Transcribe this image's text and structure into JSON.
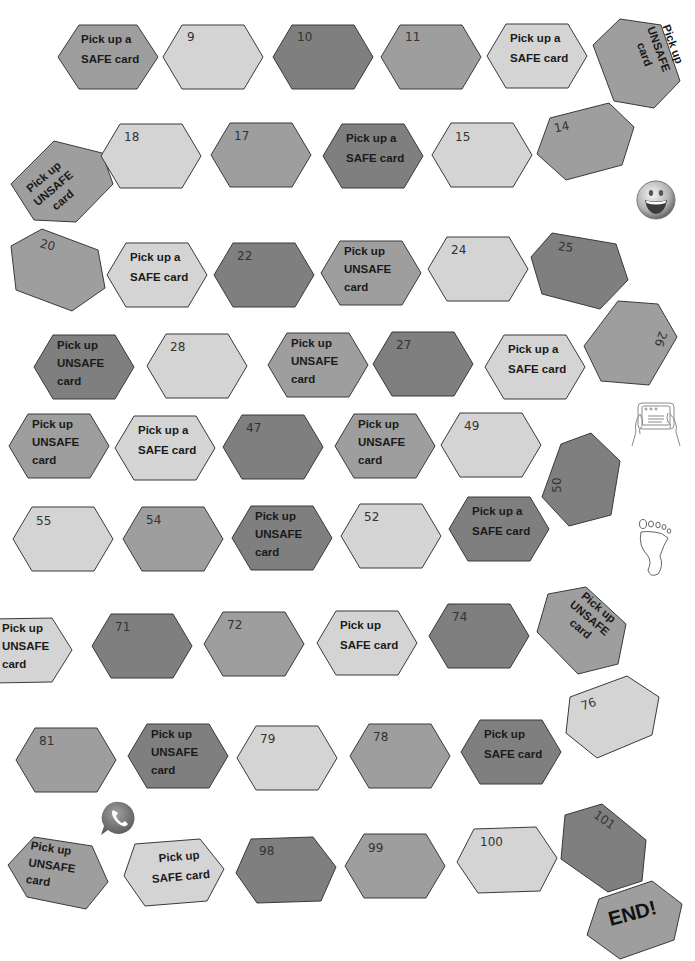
{
  "colors": {
    "light": "#d4d4d4",
    "mid": "#9e9e9e",
    "dark": "#7f7f7f",
    "border": "#3a3a3a"
  },
  "tiles": [
    {
      "id": "r1c1",
      "text": "Pick up a\nSAFE card",
      "shade": "mid"
    },
    {
      "id": "r1c2",
      "text": "9",
      "shade": "light"
    },
    {
      "id": "r1c3",
      "text": "10",
      "shade": "dark"
    },
    {
      "id": "r1c4",
      "text": "11",
      "shade": "mid"
    },
    {
      "id": "r1c5",
      "text": "Pick up a\nSAFE card",
      "shade": "light"
    },
    {
      "id": "r1c6",
      "text": "Pick up\nUNSAFE\ncard",
      "shade": "mid"
    },
    {
      "id": "r2c1",
      "text": "Pick up\nUNSAFE\ncard",
      "shade": "mid"
    },
    {
      "id": "r2c2",
      "text": "18",
      "shade": "light"
    },
    {
      "id": "r2c3",
      "text": "17",
      "shade": "mid"
    },
    {
      "id": "r2c4",
      "text": "Pick up a\nSAFE card",
      "shade": "dark"
    },
    {
      "id": "r2c5",
      "text": "15",
      "shade": "light"
    },
    {
      "id": "r2c6",
      "text": "14",
      "shade": "mid"
    },
    {
      "id": "r3c1",
      "text": "20",
      "shade": "mid"
    },
    {
      "id": "r3c2",
      "text": "Pick up a\nSAFE card",
      "shade": "light"
    },
    {
      "id": "r3c3",
      "text": "22",
      "shade": "dark"
    },
    {
      "id": "r3c4",
      "text": "Pick up\nUNSAFE\ncard",
      "shade": "mid"
    },
    {
      "id": "r3c5",
      "text": "24",
      "shade": "light"
    },
    {
      "id": "r3c6",
      "text": "25",
      "shade": "dark"
    },
    {
      "id": "r4c1",
      "text": "Pick up\nUNSAFE\ncard",
      "shade": "dark"
    },
    {
      "id": "r4c2",
      "text": "28",
      "shade": "light"
    },
    {
      "id": "r4c3",
      "text": "Pick up\nUNSAFE\ncard",
      "shade": "mid"
    },
    {
      "id": "r4c4",
      "text": "27",
      "shade": "dark"
    },
    {
      "id": "r4c5",
      "text": "Pick up a\nSAFE card",
      "shade": "light"
    },
    {
      "id": "r4c6",
      "text": "26",
      "shade": "mid"
    },
    {
      "id": "r5c1",
      "text": "Pick up\nUNSAFE\ncard",
      "shade": "mid"
    },
    {
      "id": "r5c2",
      "text": "Pick up a\nSAFE card",
      "shade": "light"
    },
    {
      "id": "r5c3",
      "text": "47",
      "shade": "dark"
    },
    {
      "id": "r5c4",
      "text": "Pick up\nUNSAFE\ncard",
      "shade": "mid"
    },
    {
      "id": "r5c5",
      "text": "49",
      "shade": "light"
    },
    {
      "id": "r5c6",
      "text": "50",
      "shade": "dark"
    },
    {
      "id": "r6c1",
      "text": "55",
      "shade": "light"
    },
    {
      "id": "r6c2",
      "text": "54",
      "shade": "mid"
    },
    {
      "id": "r6c3",
      "text": "Pick up\nUNSAFE\ncard",
      "shade": "dark"
    },
    {
      "id": "r6c4",
      "text": "52",
      "shade": "light"
    },
    {
      "id": "r6c5",
      "text": "Pick up a\nSAFE card",
      "shade": "dark"
    },
    {
      "id": "r7c1",
      "text": "Pick up\nUNSAFE\ncard",
      "shade": "light"
    },
    {
      "id": "r7c2",
      "text": "71",
      "shade": "dark"
    },
    {
      "id": "r7c3",
      "text": "72",
      "shade": "mid"
    },
    {
      "id": "r7c4",
      "text": "Pick up\nSAFE card",
      "shade": "light"
    },
    {
      "id": "r7c5",
      "text": "74",
      "shade": "dark"
    },
    {
      "id": "r7c6",
      "text": "Pick up\nUNSAFE\ncard",
      "shade": "mid"
    },
    {
      "id": "r8c1",
      "text": "81",
      "shade": "mid"
    },
    {
      "id": "r8c2",
      "text": "Pick up\nUNSAFE\ncard",
      "shade": "dark"
    },
    {
      "id": "r8c3",
      "text": "79",
      "shade": "light"
    },
    {
      "id": "r8c4",
      "text": "78",
      "shade": "mid"
    },
    {
      "id": "r8c5",
      "text": "Pick up\nSAFE card",
      "shade": "dark"
    },
    {
      "id": "r8c6",
      "text": "76",
      "shade": "light"
    },
    {
      "id": "r9c1",
      "text": "Pick up\nUNSAFE\ncard",
      "shade": "mid"
    },
    {
      "id": "r9c2",
      "text": "Pick up\nSAFE card",
      "shade": "light"
    },
    {
      "id": "r9c3",
      "text": "98",
      "shade": "dark"
    },
    {
      "id": "r9c4",
      "text": "99",
      "shade": "mid"
    },
    {
      "id": "r9c5",
      "text": "100",
      "shade": "light"
    },
    {
      "id": "r9c6",
      "text": "101",
      "shade": "dark"
    }
  ],
  "end_tile": {
    "text": "END!",
    "shade": "mid"
  },
  "decorations": [
    {
      "name": "smiley-face-icon"
    },
    {
      "name": "tablet-hands-icon"
    },
    {
      "name": "footprint-icon"
    },
    {
      "name": "phone-chat-icon"
    }
  ]
}
